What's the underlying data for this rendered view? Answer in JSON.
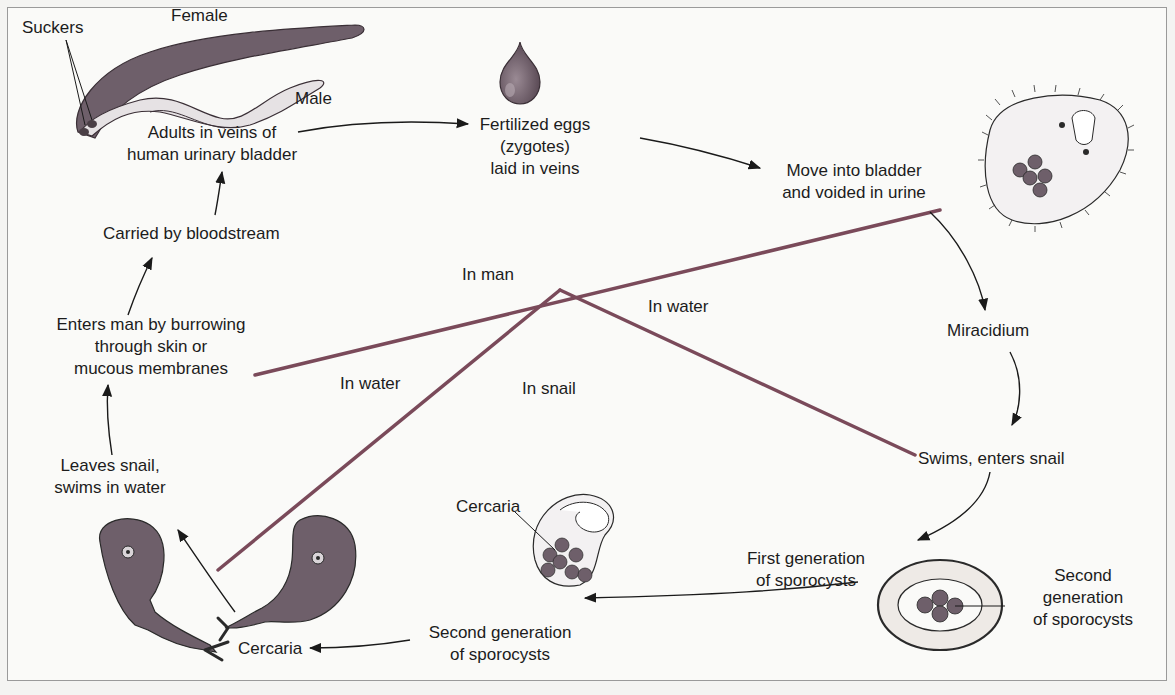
{
  "diagram": {
    "colors": {
      "background": "#fafaf8",
      "border": "#9a9a9a",
      "divider": "#7a4a5a",
      "organism_fill": "#6e5f6a",
      "organism_light": "#d9d4d8",
      "arrow": "#1a1a1a",
      "text": "#1c1c1c"
    },
    "labels": {
      "suckers": "Suckers",
      "female": "Female",
      "male": "Male",
      "adults": [
        "Adults in veins of",
        "human urinary bladder"
      ],
      "eggs": [
        "Fertilized eggs",
        "(zygotes)",
        "laid in veins"
      ],
      "bladder": [
        "Move into bladder",
        "and voided in urine"
      ],
      "miracidium": "Miracidium",
      "swims_enters": "Swims, enters snail",
      "first_gen": [
        "First generation",
        "of sporocysts"
      ],
      "second_gen_right": [
        "Second",
        "generation",
        "of sporocysts"
      ],
      "second_gen_bottom": [
        "Second generation",
        "of sporocysts"
      ],
      "cercaria_inner": "Cercaria",
      "cercaria_bottom": "Cercaria",
      "leaves_snail": [
        "Leaves snail,",
        "swims in water"
      ],
      "enters_man": [
        "Enters man by burrowing",
        "through skin or",
        "mucous membranes"
      ],
      "carried": "Carried by bloodstream"
    },
    "regions": {
      "in_man": "In man",
      "in_water_right": "In water",
      "in_water_left": "In water",
      "in_snail": "In snail"
    },
    "cycle_steps": [
      "Adults in veins of human urinary bladder",
      "Fertilized eggs (zygotes) laid in veins",
      "Move into bladder and voided in urine",
      "Miracidium",
      "Swims, enters snail",
      "First generation of sporocysts",
      "Second generation of sporocysts",
      "Cercaria",
      "Leaves snail, swims in water",
      "Enters man by burrowing through skin or mucous membranes",
      "Carried by bloodstream"
    ]
  }
}
